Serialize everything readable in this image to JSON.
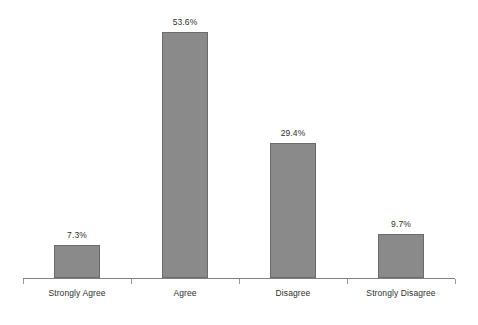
{
  "chart_data": {
    "type": "bar",
    "title": "",
    "xlabel": "",
    "ylabel": "",
    "categories": [
      "Strongly Agree",
      "Agree",
      "Disagree",
      "Strongly Disagree"
    ],
    "values": [
      7.3,
      53.6,
      29.4,
      9.7
    ],
    "value_labels": [
      "7.3%",
      "53.6%",
      "29.4%",
      "9.7%"
    ],
    "ylim": [
      0,
      58.5
    ],
    "grid": false,
    "legend": "none",
    "axis": {
      "x_axis_visible": true,
      "y_axis_visible": false,
      "tick_marks": 5
    },
    "style": {
      "bar_fill": "#8a8a8a",
      "bar_border": "#6b6b6b",
      "axis_color": "#808080",
      "text_color": "#2f2f2f",
      "background": "#ffffff"
    }
  }
}
